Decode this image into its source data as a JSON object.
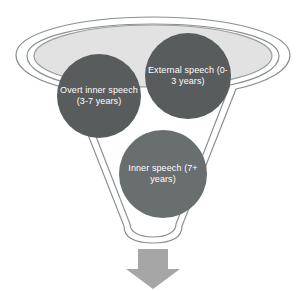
{
  "diagram": {
    "stages": [
      {
        "id": "external-speech",
        "label": "External speech (0-3 years)",
        "order": 1,
        "age_range": "0-3 years",
        "fill": "#585c5c"
      },
      {
        "id": "overt-inner-speech",
        "label": "Overt inner speech (3-7 years)",
        "order": 2,
        "age_range": "3-7 years",
        "fill": "#585c5c"
      },
      {
        "id": "inner-speech",
        "label": "Inner speech (7+ years)",
        "order": 3,
        "age_range": "7+ years",
        "fill": "#696e6e"
      }
    ],
    "funnel": {
      "outer_outline_color": "#8a8f8f",
      "inner_outline_color": "#8a8f8f",
      "body_fill": "#ffffff",
      "top_ellipse_fill": "#e2e2e2"
    },
    "arrow": {
      "name": "down-arrow",
      "direction": "down",
      "fill": "#a6a6a6"
    },
    "background": "#ffffff"
  }
}
